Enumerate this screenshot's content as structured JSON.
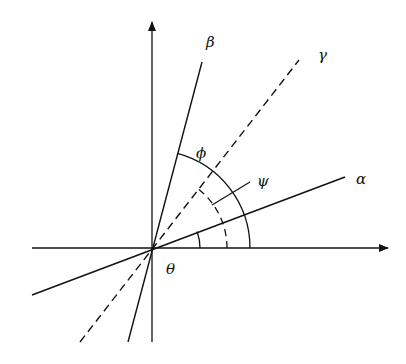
{
  "diagram": {
    "type": "angle-diagram",
    "origin": [
      152,
      248
    ],
    "axes": {
      "x_axis": {
        "from": [
          32,
          248
        ],
        "to": [
          388,
          248
        ],
        "arrow": true
      },
      "y_axis": {
        "from": [
          152,
          342
        ],
        "to": [
          152,
          22
        ],
        "arrow": true
      }
    },
    "lines": [
      {
        "name": "beta",
        "label": "β",
        "style": "solid",
        "from": [
          128,
          342
        ],
        "to": [
          202,
          62
        ],
        "label_pos": [
          206,
          47
        ]
      },
      {
        "name": "gamma",
        "label": "γ",
        "style": "dashed",
        "from": [
          80,
          342
        ],
        "to": [
          299,
          60
        ],
        "label_pos": [
          318,
          60
        ]
      },
      {
        "name": "alpha",
        "label": "α",
        "style": "solid",
        "from": [
          32,
          295
        ],
        "to": [
          345,
          177
        ],
        "label_pos": [
          356,
          184
        ]
      }
    ],
    "angles": [
      {
        "name": "theta",
        "label": "θ",
        "radius": 48,
        "style": "solid",
        "label_pos": [
          166,
          274
        ]
      },
      {
        "name": "psi",
        "label": "ψ",
        "radius": 75,
        "style": "dashed",
        "label_pos": [
          257,
          186
        ],
        "leader": [
          [
            212,
            205
          ],
          [
            250,
            182
          ]
        ]
      },
      {
        "name": "phi",
        "label": "ϕ",
        "radius": 98,
        "style": "solid",
        "label_pos": [
          196,
          158
        ]
      }
    ],
    "stroke_color": "#111111",
    "background": "#ffffff"
  }
}
